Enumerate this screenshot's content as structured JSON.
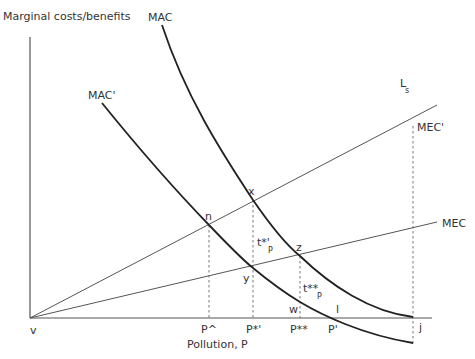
{
  "diagram": {
    "y_axis_label": "Marginal costs/benefits",
    "x_axis_label": "Pollution, P",
    "curves": {
      "mac": "MAC",
      "mac_prime": "MAC'",
      "ls": "L",
      "ls_sub": "s",
      "mec": "MEC",
      "mec_prime": "MEC'"
    },
    "points": {
      "x": "x",
      "n": "n",
      "z": "z",
      "y": "y",
      "w": "w",
      "l": "l",
      "v": "v",
      "j": "j"
    },
    "tax_labels": {
      "t1": "t*'",
      "t1_sub": "P",
      "t2": "t**",
      "t2_sub": "P"
    },
    "x_ticks": {
      "p_hat": "P^",
      "p_star_prime": "P*'",
      "p_star_star": "P**",
      "p_prime": "P'"
    }
  }
}
